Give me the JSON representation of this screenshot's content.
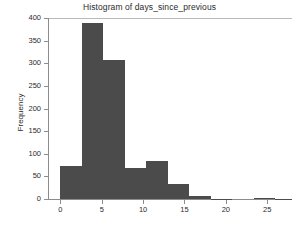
{
  "chart_data": {
    "type": "bar",
    "title": "Histogram of days_since_previous",
    "xlabel": "",
    "ylabel": "Frequency",
    "xlim": [
      -1.5,
      28.0
    ],
    "ylim": [
      0,
      400
    ],
    "grid": false,
    "legend": null,
    "bar_color": "#4b4b4b",
    "bin_width": 2.6,
    "xticks": [
      0,
      5,
      10,
      15,
      20,
      25
    ],
    "xtick_labels": [
      "0",
      "5",
      "10",
      "15",
      "20",
      "25"
    ],
    "yticks": [
      0,
      50,
      100,
      150,
      200,
      250,
      300,
      350,
      400
    ],
    "ytick_labels": [
      "0",
      "50",
      "100",
      "150",
      "200",
      "250",
      "300",
      "350",
      "400"
    ],
    "bins": [
      {
        "x0": 0.0,
        "x1": 2.6,
        "value": 73
      },
      {
        "x0": 2.6,
        "x1": 5.2,
        "value": 388
      },
      {
        "x0": 5.2,
        "x1": 7.8,
        "value": 308
      },
      {
        "x0": 7.8,
        "x1": 10.4,
        "value": 68
      },
      {
        "x0": 10.4,
        "x1": 13.0,
        "value": 83
      },
      {
        "x0": 13.0,
        "x1": 15.6,
        "value": 34
      },
      {
        "x0": 15.6,
        "x1": 18.2,
        "value": 6
      },
      {
        "x0": 18.2,
        "x1": 20.8,
        "value": 1
      },
      {
        "x0": 20.8,
        "x1": 23.4,
        "value": 0
      },
      {
        "x0": 23.4,
        "x1": 26.0,
        "value": 2
      },
      {
        "x0": 26.0,
        "x1": 28.0,
        "value": 1
      }
    ]
  }
}
